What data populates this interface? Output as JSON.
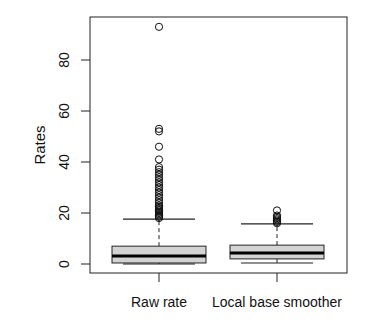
{
  "chart_data": {
    "type": "boxplot",
    "title": "",
    "xlabel": "",
    "ylabel": "Rates",
    "ylim": [
      -3.5,
      97
    ],
    "yticks": [
      0,
      20,
      40,
      60,
      80
    ],
    "categories": [
      "Raw rate",
      "Local base smoother"
    ],
    "series": [
      {
        "name": "Raw rate",
        "whisker_low": 0,
        "q1": 0.4,
        "median": 3.1,
        "q3": 7.0,
        "whisker_high": 17.6,
        "outliers": [
          18,
          18.5,
          19,
          19.5,
          20,
          20.5,
          21,
          21.5,
          22,
          22.5,
          23,
          24,
          25,
          26,
          27,
          28,
          29,
          30,
          31,
          32,
          33,
          34,
          35,
          36,
          37,
          38,
          41,
          46,
          52,
          53,
          93
        ]
      },
      {
        "name": "Local base smoother",
        "whisker_low": 0.4,
        "q1": 2.0,
        "median": 4.3,
        "q3": 7.4,
        "whisker_high": 15.7,
        "outliers": [
          16,
          16.5,
          17,
          17.5,
          18,
          18.5,
          19,
          21
        ]
      }
    ],
    "box_fill": "#d3d3d3",
    "grid": false,
    "legend": null
  }
}
